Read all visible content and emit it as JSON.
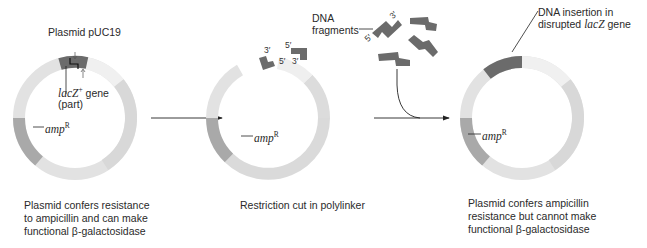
{
  "figure": {
    "panels": [
      {
        "id": "intact-plasmid",
        "title": "Plasmid pUC19",
        "gene_label_main": "lacZ",
        "gene_label_sup": "+",
        "gene_label_rest": " gene",
        "gene_label_part": "(part)",
        "amp_label": "amp",
        "amp_sup": "R",
        "caption": [
          "Plasmid confers resistance",
          "to ampicillin and can make",
          "functional β-galactosidase"
        ]
      },
      {
        "id": "cut-plasmid",
        "end_labels": [
          "3′",
          "5′",
          "5′",
          "3′"
        ],
        "amp_label": "amp",
        "amp_sup": "R",
        "caption": [
          "Restriction cut in polylinker"
        ]
      },
      {
        "id": "recombinant-plasmid",
        "insert_label_line1": "DNA insertion in",
        "insert_label_line2_pre": "disrupted ",
        "insert_label_line2_gene": "lacZ",
        "insert_label_line2_post": " gene",
        "amp_label": "amp",
        "amp_sup": "R",
        "caption": [
          "Plasmid confers ampicillin",
          "resistance but cannot make",
          "functional β-galactosidase"
        ]
      }
    ],
    "fragments": {
      "label_line1": "DNA",
      "label_line2": "fragments",
      "end_labels": [
        "5′",
        "3′"
      ]
    },
    "colors": {
      "ring_light": "#e4e4e4",
      "ring_lighter": "#efefef",
      "ring_mid": "#d9d9d9",
      "amp_segment": "#a8a8a8",
      "lacz_segment": "#6e6e6e",
      "arrow": "#222222"
    }
  }
}
